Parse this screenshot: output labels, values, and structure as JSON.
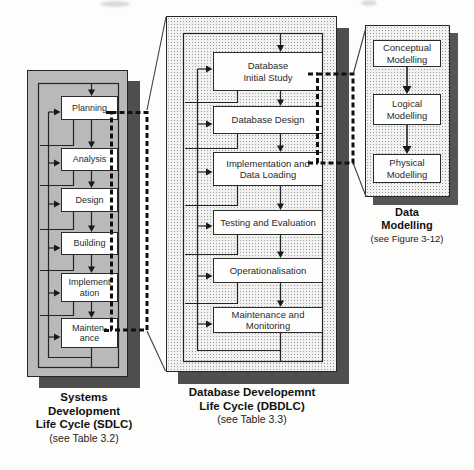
{
  "figure_title": "Linked life-cycle diagram",
  "sdlc": {
    "caption_lines": [
      "Systems",
      "Development",
      "Life Cycle (SDLC)"
    ],
    "caption_note": "(see Table 3.2)",
    "nodes": [
      {
        "label": "Planning"
      },
      {
        "label": "Analysis"
      },
      {
        "label": "Design"
      },
      {
        "label": "Building"
      },
      {
        "label": "Implement\nation"
      },
      {
        "label": "Mainten-\nance"
      }
    ]
  },
  "dbdlc": {
    "caption_lines": [
      "Database Developemnt",
      "Life Cycle (DBDLC)"
    ],
    "caption_note": "(see Table 3.3)",
    "nodes": [
      {
        "label": "Database\nInitial Study"
      },
      {
        "label": "Database Design"
      },
      {
        "label": "Implementation and\nData Loading"
      },
      {
        "label": "Testing and Evaluation"
      },
      {
        "label": "Operationalisation"
      },
      {
        "label": "Maintenance and\nMonitoring"
      }
    ]
  },
  "data_modelling": {
    "caption_lines": [
      "Data",
      "Modelling"
    ],
    "caption_note": "(see Figure 3-12)",
    "nodes": [
      {
        "label": "Conceptual\nModelling"
      },
      {
        "label": "Logical\nModelling"
      },
      {
        "label": "Physical\nModelling"
      }
    ]
  },
  "colors": {
    "page_bg": "#fdfdfb",
    "gray_panel": "#b9b9b9",
    "stipple_bg": "#f1f1ef",
    "stipple_dot": "#9c9c9c",
    "shadow": "#4e4e4e",
    "line": "#232323",
    "dashed_link": "#101010",
    "box_bg": "#fefefe",
    "box_border": "#2b2b2b",
    "text": "#111111"
  }
}
